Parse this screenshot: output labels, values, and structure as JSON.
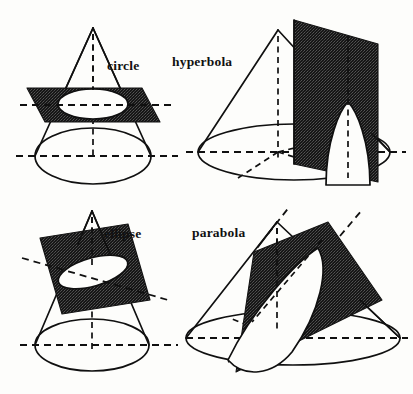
{
  "figure": {
    "background_color": "#fdfdfb",
    "ink_color": "#101010",
    "plane_color": "#1a1a1a",
    "panel_count": 4
  },
  "panels": [
    {
      "id": "circle",
      "label": "circle",
      "position": "top-left",
      "label_x": 107,
      "label_y": 70,
      "plane_orientation": "horizontal",
      "section_shape": "ellipse-outline-representing-circle",
      "cone": {
        "apex_x": 93,
        "apex_y": 28,
        "base_center_x": 93,
        "base_center_y": 156,
        "base_rx": 58,
        "base_ry": 28
      },
      "cut": {
        "center_x": 93,
        "center_y": 104,
        "rx": 35,
        "ry": 15,
        "tilt_deg": 0
      }
    },
    {
      "id": "hyperbola",
      "label": "hyperbola",
      "position": "top-right",
      "label_x": 172,
      "label_y": 66,
      "plane_orientation": "vertical",
      "section_shape": "hyperbola-branch",
      "cone": {
        "apex_x": 278,
        "apex_y": 30,
        "base_center_x": 294,
        "base_center_y": 152,
        "base_rx": 96,
        "base_ry": 28
      }
    },
    {
      "id": "ellipse",
      "label": "ellipse",
      "position": "bottom-left",
      "label_x": 104,
      "label_y": 238,
      "plane_orientation": "oblique-shallow",
      "section_shape": "ellipse",
      "cone": {
        "apex_x": 92,
        "apex_y": 211,
        "base_center_x": 92,
        "base_center_y": 345,
        "base_rx": 57,
        "base_ry": 26
      },
      "cut": {
        "center_x": 93,
        "center_y": 275,
        "rx": 36,
        "ry": 14,
        "tilt_deg": 20
      }
    },
    {
      "id": "parabola",
      "label": "parabola",
      "position": "bottom-right",
      "label_x": 192,
      "label_y": 237,
      "plane_orientation": "oblique-parallel-to-slant",
      "section_shape": "parabola",
      "cone": {
        "apex_x": 277,
        "apex_y": 222,
        "base_center_x": 293,
        "base_center_y": 338,
        "base_rx": 107,
        "base_ry": 27
      }
    }
  ],
  "labels": {
    "circle": "circle",
    "hyperbola": "hyperbola",
    "ellipse": "ellipse",
    "parabola": "parabola"
  }
}
